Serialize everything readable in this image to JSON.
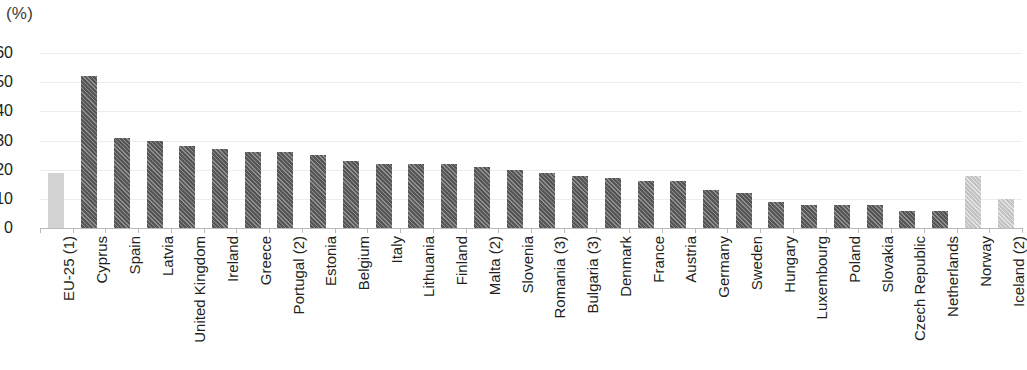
{
  "chart_data": {
    "type": "bar",
    "title": "",
    "subtitle": "",
    "unit_label": "(%)",
    "xlabel": "",
    "ylabel": "",
    "ylim": [
      0,
      60
    ],
    "ytick_step": 10,
    "yticks": [
      60,
      50,
      40,
      30,
      20,
      10,
      0
    ],
    "grid": true,
    "legend": "none",
    "orientation": "vertical",
    "categories": [
      "EU-25 (1)",
      "Cyprus",
      "Spain",
      "Latvia",
      "United Kingdom",
      "Ireland",
      "Greece",
      "Portugal (2)",
      "Estonia",
      "Belgium",
      "Italy",
      "Lithuania",
      "Finland",
      "Malta (2)",
      "Slovenia",
      "Romania (3)",
      "Bulgaria (3)",
      "Denmark",
      "France",
      "Austria",
      "Germany",
      "Sweden",
      "Hungary",
      "Luxembourg",
      "Poland",
      "Slovakia",
      "Czech Republic",
      "Netherlands",
      "Norway",
      "Iceland (2)"
    ],
    "values": [
      19,
      52,
      31,
      30,
      28,
      27,
      26,
      26,
      25,
      23,
      22,
      22,
      22,
      21,
      20,
      19,
      18,
      17,
      16,
      16,
      13,
      12,
      9,
      8,
      8,
      8,
      6,
      6,
      18,
      10
    ],
    "bar_styles": [
      "light",
      "dark",
      "dark",
      "dark",
      "dark",
      "dark",
      "dark",
      "dark",
      "dark",
      "dark",
      "dark",
      "dark",
      "dark",
      "dark",
      "dark",
      "dark",
      "dark",
      "dark",
      "dark",
      "dark",
      "dark",
      "dark",
      "dark",
      "dark",
      "dark",
      "dark",
      "dark",
      "dark",
      "lighthatch",
      "lighthatch"
    ],
    "colors": {
      "bar_dark": "#565656",
      "bar_light": "#d2d2d2",
      "bar_light_hatched": "#c3c3c3",
      "gridline": "#ececec",
      "axis": "#b9b9b9",
      "text": "#231f20",
      "background": "#ffffff"
    }
  }
}
